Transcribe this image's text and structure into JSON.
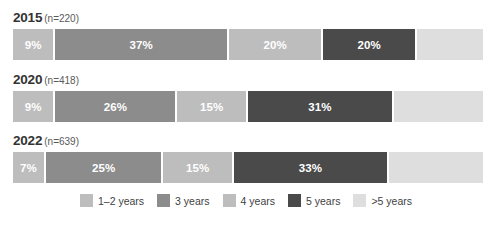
{
  "chart_data": {
    "type": "bar",
    "subtype": "stacked-horizontal-100pct",
    "title": "",
    "xlabel": "",
    "ylabel": "",
    "grid": false,
    "legend_position": "bottom-center",
    "xlim": [
      0,
      100
    ],
    "categories": [
      "2015",
      "2020",
      "2022"
    ],
    "category_annotations": [
      "(n=220)",
      "(n=418)",
      "(n=639)"
    ],
    "series": [
      {
        "name": "1–2 years",
        "color": "#bdbdbd",
        "values": [
          9,
          9,
          7
        ]
      },
      {
        "name": "3 years",
        "color": "#8c8c8c",
        "values": [
          37,
          26,
          25
        ]
      },
      {
        "name": "4 years",
        "color": "#bdbdbd",
        "values": [
          20,
          15,
          15
        ]
      },
      {
        "name": "5 years",
        "color": "#4a4a4a",
        "values": [
          20,
          31,
          33
        ]
      },
      {
        "name": ">5 years",
        "color": "#dedede",
        "values": [
          14,
          19,
          20
        ]
      }
    ],
    "data_labels": [
      [
        "9%",
        "37%",
        "20%",
        "20%",
        ""
      ],
      [
        "9%",
        "26%",
        "15%",
        "31%",
        ""
      ],
      [
        "7%",
        "25%",
        "15%",
        "33%",
        ""
      ]
    ]
  },
  "groups": [
    {
      "year": "2015",
      "n": "(n=220)",
      "segments": [
        {
          "label": "9%",
          "pct": 9,
          "color": "#bdbdbd",
          "series": "1–2 years"
        },
        {
          "label": "37%",
          "pct": 37,
          "color": "#8c8c8c",
          "series": "3 years"
        },
        {
          "label": "20%",
          "pct": 20,
          "color": "#bdbdbd",
          "series": "4 years"
        },
        {
          "label": "20%",
          "pct": 20,
          "color": "#4a4a4a",
          "series": "5 years"
        },
        {
          "label": "",
          "pct": 14,
          "color": "#dedede",
          "series": ">5 years"
        }
      ]
    },
    {
      "year": "2020",
      "n": "(n=418)",
      "segments": [
        {
          "label": "9%",
          "pct": 9,
          "color": "#bdbdbd",
          "series": "1–2 years"
        },
        {
          "label": "26%",
          "pct": 26,
          "color": "#8c8c8c",
          "series": "3 years"
        },
        {
          "label": "15%",
          "pct": 15,
          "color": "#bdbdbd",
          "series": "4 years"
        },
        {
          "label": "31%",
          "pct": 31,
          "color": "#4a4a4a",
          "series": "5 years"
        },
        {
          "label": "",
          "pct": 19,
          "color": "#dedede",
          "series": ">5 years"
        }
      ]
    },
    {
      "year": "2022",
      "n": "(n=639)",
      "segments": [
        {
          "label": "7%",
          "pct": 7,
          "color": "#bdbdbd",
          "series": "1–2 years"
        },
        {
          "label": "25%",
          "pct": 25,
          "color": "#8c8c8c",
          "series": "3 years"
        },
        {
          "label": "15%",
          "pct": 15,
          "color": "#bdbdbd",
          "series": "4 years"
        },
        {
          "label": "33%",
          "pct": 33,
          "color": "#4a4a4a",
          "series": "5 years"
        },
        {
          "label": "",
          "pct": 20,
          "color": "#dedede",
          "series": ">5 years"
        }
      ]
    }
  ],
  "legend": {
    "items": [
      {
        "label": "1–2 years",
        "color": "#bdbdbd"
      },
      {
        "label": "3 years",
        "color": "#8c8c8c"
      },
      {
        "label": "4 years",
        "color": "#bdbdbd"
      },
      {
        "label": "5 years",
        "color": "#4a4a4a"
      },
      {
        "label": ">5 years",
        "color": "#dedede"
      }
    ]
  }
}
